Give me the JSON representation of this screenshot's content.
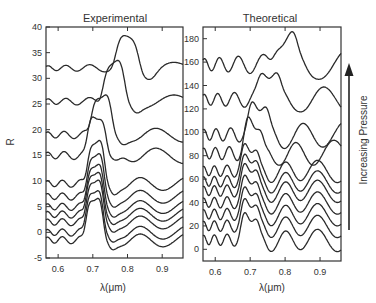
{
  "chart_data": [
    {
      "type": "line",
      "title": "Experimental",
      "xlabel": "λ(μm)",
      "ylabel": "R",
      "xlim": [
        0.565,
        0.96
      ],
      "ylim": [
        -5,
        40
      ],
      "xticks": [
        "0.6",
        "0.7",
        "0.8",
        "0.9"
      ],
      "xtick_values": [
        0.6,
        0.7,
        0.8,
        0.9
      ],
      "yticks": [
        "40",
        "35",
        "30",
        "25",
        "20",
        "15",
        "10",
        "5",
        "0",
        "-5"
      ],
      "ytick_values": [
        40,
        35,
        30,
        25,
        20,
        15,
        10,
        5,
        0,
        -5
      ],
      "grid": false,
      "series": [
        {
          "name": "curve-1",
          "baseline": -1.5,
          "peak_center": 0.705,
          "peak_height": 8.5,
          "peak_width": 0.022,
          "osc_amp": 1.0,
          "osc_period": 0.06
        },
        {
          "name": "curve-2",
          "baseline": 0.0,
          "peak_center": 0.705,
          "peak_height": 8.5,
          "peak_width": 0.022,
          "osc_amp": 1.0,
          "osc_period": 0.06
        },
        {
          "name": "curve-3",
          "baseline": 2.0,
          "peak_center": 0.706,
          "peak_height": 8.5,
          "peak_width": 0.022,
          "osc_amp": 1.0,
          "osc_period": 0.06
        },
        {
          "name": "curve-4",
          "baseline": 3.5,
          "peak_center": 0.706,
          "peak_height": 8.5,
          "peak_width": 0.022,
          "osc_amp": 1.0,
          "osc_period": 0.06
        },
        {
          "name": "curve-5",
          "baseline": 5.0,
          "peak_center": 0.707,
          "peak_height": 8.5,
          "peak_width": 0.022,
          "osc_amp": 1.0,
          "osc_period": 0.06
        },
        {
          "name": "curve-6",
          "baseline": 7.0,
          "peak_center": 0.708,
          "peak_height": 8.5,
          "peak_width": 0.022,
          "osc_amp": 1.0,
          "osc_period": 0.06
        },
        {
          "name": "curve-7",
          "baseline": 9.5,
          "peak_center": 0.709,
          "peak_height": 8.5,
          "peak_width": 0.022,
          "osc_amp": 1.0,
          "osc_period": 0.06
        },
        {
          "name": "curve-8",
          "baseline": 15.0,
          "peak_center": 0.712,
          "peak_height": 8.0,
          "peak_width": 0.024,
          "osc_amp": 1.1,
          "osc_period": 0.065
        },
        {
          "name": "curve-9",
          "baseline": 19.0,
          "peak_center": 0.725,
          "peak_height": 8.0,
          "peak_width": 0.026,
          "osc_amp": 1.0,
          "osc_period": 0.065
        },
        {
          "name": "curve-10",
          "baseline": 25.5,
          "peak_center": 0.76,
          "peak_height": 7.5,
          "peak_width": 0.028,
          "osc_amp": 0.9,
          "osc_period": 0.07
        },
        {
          "name": "curve-11",
          "baseline": 32.0,
          "peak_center": 0.8,
          "peak_height": 5.5,
          "peak_width": 0.03,
          "osc_amp": 0.8,
          "osc_period": 0.07
        }
      ]
    },
    {
      "type": "line",
      "title": "Theoretical",
      "xlabel": "λ(μm)",
      "ylabel": "",
      "xlim": [
        0.565,
        0.96
      ],
      "ylim": [
        -10,
        190
      ],
      "xticks": [
        "0.6",
        "0.7",
        "0.8",
        "0.9"
      ],
      "xtick_values": [
        0.6,
        0.7,
        0.8,
        0.9
      ],
      "yticks": [
        "180",
        "160",
        "140",
        "120",
        "100",
        "80",
        "60",
        "40",
        "20",
        "0"
      ],
      "ytick_values": [
        180,
        160,
        140,
        120,
        100,
        80,
        60,
        40,
        20,
        0
      ],
      "grid": false,
      "series": [
        {
          "name": "curve-1",
          "baseline": 8,
          "peak_center": 0.7,
          "peak_height": 22,
          "peak_width": 0.022,
          "osc_amp": 7,
          "osc_period": 0.045
        },
        {
          "name": "curve-2",
          "baseline": 20,
          "peak_center": 0.7,
          "peak_height": 22,
          "peak_width": 0.022,
          "osc_amp": 7,
          "osc_period": 0.045
        },
        {
          "name": "curve-3",
          "baseline": 30,
          "peak_center": 0.7,
          "peak_height": 22,
          "peak_width": 0.022,
          "osc_amp": 7,
          "osc_period": 0.045
        },
        {
          "name": "curve-4",
          "baseline": 40,
          "peak_center": 0.7,
          "peak_height": 22,
          "peak_width": 0.022,
          "osc_amp": 7,
          "osc_period": 0.045
        },
        {
          "name": "curve-5",
          "baseline": 50,
          "peak_center": 0.7,
          "peak_height": 22,
          "peak_width": 0.022,
          "osc_amp": 7,
          "osc_period": 0.045
        },
        {
          "name": "curve-6",
          "baseline": 58,
          "peak_center": 0.7,
          "peak_height": 22,
          "peak_width": 0.022,
          "osc_amp": 7,
          "osc_period": 0.045
        },
        {
          "name": "curve-7",
          "baseline": 67,
          "peak_center": 0.7,
          "peak_height": 22,
          "peak_width": 0.022,
          "osc_amp": 7,
          "osc_period": 0.045
        },
        {
          "name": "curve-8",
          "baseline": 82,
          "peak_center": 0.71,
          "peak_height": 28,
          "peak_width": 0.024,
          "osc_amp": 8,
          "osc_period": 0.048
        },
        {
          "name": "curve-9",
          "baseline": 98,
          "peak_center": 0.725,
          "peak_height": 28,
          "peak_width": 0.026,
          "osc_amp": 8,
          "osc_period": 0.05
        },
        {
          "name": "curve-10",
          "baseline": 128,
          "peak_center": 0.755,
          "peak_height": 26,
          "peak_width": 0.028,
          "osc_amp": 8,
          "osc_period": 0.055
        },
        {
          "name": "curve-11",
          "baseline": 158,
          "peak_center": 0.8,
          "peak_height": 24,
          "peak_width": 0.03,
          "osc_amp": 9,
          "osc_period": 0.06
        }
      ]
    }
  ],
  "annotation": {
    "arrow_label": "Increasing Pressure",
    "arrow_direction": "up"
  },
  "colors": {
    "line": "#2a2a2a",
    "axis": "#333333",
    "background": "#ffffff"
  }
}
